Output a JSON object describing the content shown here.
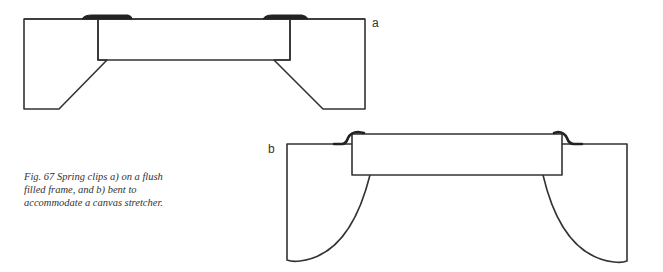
{
  "figure": {
    "caption_lines": [
      "Fig. 67   Spring clips a) on a flush",
      "filled frame, and b) bent to",
      "accommodate a canvas stretcher."
    ],
    "panels": [
      {
        "id": "a",
        "label": "a",
        "description": "Spring clips on a flush filled frame"
      },
      {
        "id": "b",
        "label": "b",
        "description": "Spring clips bent to accommodate a canvas stretcher"
      }
    ],
    "colors": {
      "line": "#333333",
      "clip": "#222222",
      "background": "#ffffff"
    }
  }
}
